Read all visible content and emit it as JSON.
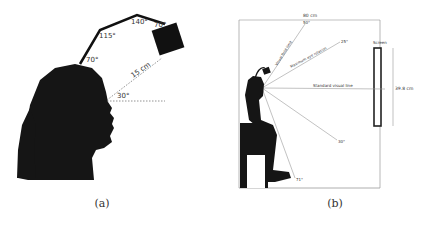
{
  "figure": {
    "panels": [
      {
        "id": "a",
        "caption": "(a)",
        "labels": {
          "angle_top_left": "70°",
          "angle_mid": "115°",
          "angle_top": "140°",
          "angle_cam": "70°",
          "distance": "15 cm",
          "gaze_angle": "30°"
        }
      },
      {
        "id": "b",
        "caption": "(b)",
        "labels": {
          "width": "80 cm",
          "screen": "Screen",
          "screen_height": "39.8 cm",
          "visual_field_limit": "Visual field limit",
          "visual_field_angle": "50°",
          "max_eye_rotation": "Maximum eye rotation",
          "max_eye_angle": "25°",
          "standard_line": "Standard visual line",
          "down_angle_1": "30°",
          "down_angle_2": "71°"
        }
      }
    ]
  }
}
